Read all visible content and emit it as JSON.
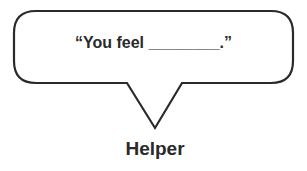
{
  "bubble": {
    "text": "“You feel ________.”",
    "stroke_color": "#2a2a2a"
  },
  "speaker": {
    "label": "Helper"
  }
}
